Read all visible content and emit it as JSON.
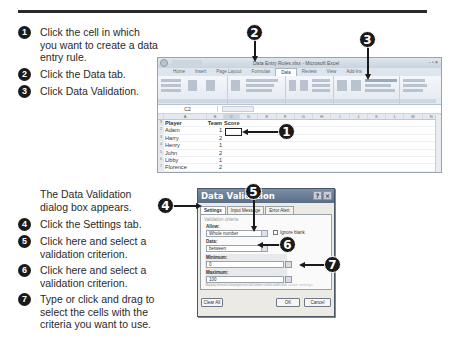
{
  "instructions_top": [
    {
      "num": "1",
      "text": "Click the cell in which you want to create a data entry rule."
    },
    {
      "num": "2",
      "text": "Click the Data tab."
    },
    {
      "num": "3",
      "text": "Click Data Validation."
    }
  ],
  "instructions_bottom_intro": "The Data Validation dialog box appears.",
  "instructions_bottom": [
    {
      "num": "4",
      "text": "Click the Settings tab."
    },
    {
      "num": "5",
      "text": "Click here and select a validation criterion."
    },
    {
      "num": "6",
      "text": "Click here and select a validation criterion."
    },
    {
      "num": "7",
      "text": "Type or click and drag to select the cells with the criteria you want to use."
    }
  ],
  "excel": {
    "title": "Data Entry Rules.xlsx - Microsoft Excel",
    "window_controls": "- ▫ ×",
    "tabs": [
      "Home",
      "Insert",
      "Page Layout",
      "Formulas",
      "Data",
      "Review",
      "View",
      "Add-Ins"
    ],
    "active_tab": "Data",
    "ribbon_items": {
      "data_validation": "Data Validation",
      "consolidate": "Consolidate",
      "what_if": "What-If Analysis",
      "group": "Group",
      "ungroup": "Ungroup",
      "subtotal": "Subtotal",
      "sort": "Sort",
      "filter": "Filter",
      "text_to_columns": "Text to Columns",
      "remove_duplicates": "Remove Duplicates",
      "data_tools_group": "Data Tools",
      "outline_group": "Outline"
    },
    "name_box": "C2",
    "columns": [
      "A",
      "B",
      "C",
      "D",
      "E",
      "F",
      "G",
      "H",
      "I",
      "J",
      "K",
      "L",
      "M",
      "N"
    ],
    "rows": [
      {
        "n": "1",
        "a": "Player",
        "b": "Team",
        "c": "Score"
      },
      {
        "n": "2",
        "a": "Adam",
        "b": "1",
        "c": ""
      },
      {
        "n": "3",
        "a": "Harry",
        "b": "2",
        "c": ""
      },
      {
        "n": "4",
        "a": "Henry",
        "b": "1",
        "c": ""
      },
      {
        "n": "5",
        "a": "John",
        "b": "2",
        "c": ""
      },
      {
        "n": "6",
        "a": "Libby",
        "b": "1",
        "c": ""
      },
      {
        "n": "7",
        "a": "Florence",
        "b": "2",
        "c": ""
      },
      {
        "n": "8",
        "a": "Mary",
        "b": "1",
        "c": ""
      }
    ]
  },
  "dialog": {
    "title": "Data Validation",
    "help": "?",
    "close": "×",
    "tabs": [
      "Settings",
      "Input Message",
      "Error Alert"
    ],
    "active_tab": "Settings",
    "section": "Validation criteria",
    "allow_label": "Allow:",
    "allow_value": "Whole number",
    "ignore_blank": "Ignore blank",
    "data_label": "Data:",
    "data_value": "between",
    "minimum_label": "Minimum:",
    "minimum_value": "0",
    "maximum_label": "Maximum:",
    "maximum_value": "100",
    "apply_text": "Apply these changes to all other cells with the same settings",
    "clear_all": "Clear All",
    "ok": "OK",
    "cancel": "Cancel"
  },
  "callouts": [
    "1",
    "2",
    "3",
    "4",
    "5",
    "6",
    "7"
  ]
}
